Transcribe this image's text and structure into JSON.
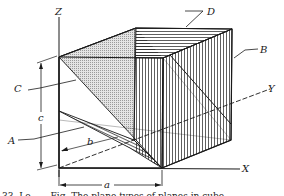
{
  "figure": {
    "type": "isometric cube with crystal planes",
    "axes": {
      "z": "Z",
      "x": "X",
      "y": "Y"
    },
    "plane_labels": {
      "a": "A",
      "b": "B",
      "c": "C",
      "d": "D"
    },
    "dimensions": {
      "a": "a",
      "b": "b",
      "c": "c"
    },
    "caption_fragment": "33. Lo . . .   Fig. The plane types of planes in cube",
    "colors": {
      "ink": "#1a1a1a",
      "stipple": "#c8c8c8",
      "background": "#ffffff"
    }
  }
}
